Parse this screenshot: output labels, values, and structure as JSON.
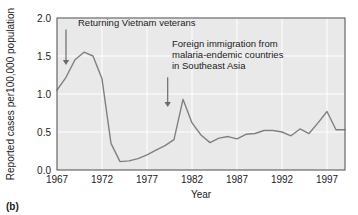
{
  "figure": {
    "panel_label": "(b)"
  },
  "chart_data": {
    "type": "line",
    "title": "",
    "xlabel": "Year",
    "ylabel": "Reported cases per100,000 population",
    "xlim": [
      1967,
      1999
    ],
    "ylim": [
      0.0,
      2.0
    ],
    "grid": true,
    "legend": "none",
    "xticks": [
      "1967",
      "1972",
      "1977",
      "1982",
      "1987",
      "1992",
      "1997"
    ],
    "xtick_values": [
      1967,
      1972,
      1977,
      1982,
      1987,
      1992,
      1997
    ],
    "yticks": [
      "0.0",
      "0.5",
      "1.0",
      "1.5",
      "2.0"
    ],
    "ytick_values": [
      0.0,
      0.5,
      1.0,
      1.5,
      2.0
    ],
    "series": [
      {
        "name": "Reported malaria cases per 100,000 population",
        "color": "#808080",
        "x": [
          1967,
          1968,
          1969,
          1970,
          1971,
          1972,
          1973,
          1974,
          1975,
          1976,
          1977,
          1978,
          1979,
          1980,
          1981,
          1982,
          1983,
          1984,
          1985,
          1986,
          1987,
          1988,
          1989,
          1990,
          1991,
          1992,
          1993,
          1994,
          1995,
          1996,
          1997,
          1998,
          1999
        ],
        "values": [
          1.05,
          1.22,
          1.45,
          1.55,
          1.5,
          1.2,
          0.35,
          0.11,
          0.12,
          0.15,
          0.2,
          0.26,
          0.32,
          0.4,
          0.93,
          0.62,
          0.46,
          0.36,
          0.42,
          0.44,
          0.41,
          0.47,
          0.48,
          0.52,
          0.52,
          0.5,
          0.45,
          0.54,
          0.48,
          0.62,
          0.77,
          0.53,
          0.53
        ]
      }
    ],
    "annotations": [
      {
        "id": "vietnam-veterans",
        "lines": [
          "Returning Vietnam veterans"
        ],
        "arrow_year": 1968,
        "arrow_from_value": 1.85,
        "arrow_to_value": 1.38
      },
      {
        "id": "foreign-immigration",
        "lines": [
          "Foreign immigration from",
          "malaria-endemic countries",
          "in Southeast Asia"
        ],
        "arrow_year": 1979.3,
        "arrow_from_value": 1.22,
        "arrow_to_value": 0.83
      }
    ],
    "colors": {
      "line": "#808080",
      "plot_background": "#e9e9e9",
      "gridline": "#ffffff",
      "frame": "#5a5a5a",
      "text": "#1b1b1b",
      "arrow": "#6b6b6b"
    }
  }
}
